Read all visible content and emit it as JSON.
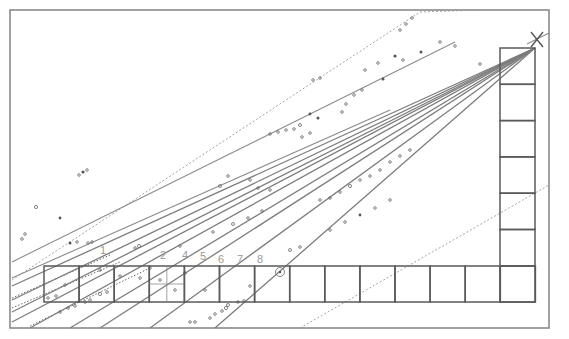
{
  "diagram": {
    "type": "ray-fan perspective construction",
    "frame": {
      "x": 10,
      "y": 10,
      "width": 539,
      "height": 318
    },
    "apex": {
      "label": "X",
      "x": 537,
      "y": 40
    },
    "bottom_row": {
      "x": 44,
      "y": 266,
      "cell_width": 35.1,
      "cell_height": 36,
      "count": 14
    },
    "right_column": {
      "x": 500,
      "y": 48,
      "cell_width": 35,
      "cell_height": 36.3,
      "count": 7
    },
    "subdivided_cell_index": 3,
    "circled_mark": {
      "label": "o",
      "x": 280,
      "y": 272
    },
    "ray_labels": [
      {
        "text": "1",
        "x": 100,
        "y": 254
      },
      {
        "text": "2",
        "x": 160,
        "y": 259
      },
      {
        "text": "4",
        "x": 182,
        "y": 259
      },
      {
        "text": "5",
        "x": 200,
        "y": 260
      },
      {
        "text": "6",
        "x": 218,
        "y": 263
      },
      {
        "text": "7",
        "x": 237,
        "y": 263
      },
      {
        "text": "8",
        "x": 257,
        "y": 263
      }
    ],
    "rays": [
      {
        "from": [
          535,
          48
        ],
        "to": [
          12,
          286
        ]
      },
      {
        "from": [
          535,
          48
        ],
        "to": [
          12,
          300
        ]
      },
      {
        "from": [
          535,
          48
        ],
        "to": [
          12,
          312
        ]
      },
      {
        "from": [
          535,
          48
        ],
        "to": [
          12,
          322
        ]
      },
      {
        "from": [
          535,
          48
        ],
        "to": [
          30,
          328
        ]
      },
      {
        "from": [
          535,
          48
        ],
        "to": [
          70,
          328
        ]
      },
      {
        "from": [
          535,
          48
        ],
        "to": [
          100,
          328
        ]
      },
      {
        "from": [
          535,
          48
        ],
        "to": [
          150,
          328
        ]
      },
      {
        "from": [
          535,
          48
        ],
        "to": [
          215,
          328
        ]
      }
    ],
    "dotted_lines": [
      {
        "from": [
          12,
          280
        ],
        "to": [
          420,
          12
        ]
      },
      {
        "from": [
          300,
          328
        ],
        "to": [
          549,
          185
        ]
      }
    ]
  }
}
